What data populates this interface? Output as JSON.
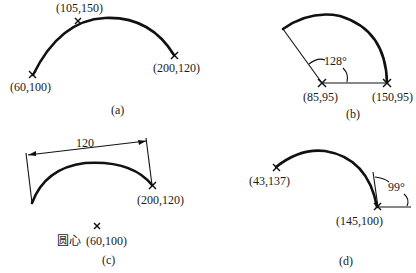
{
  "figures": {
    "a": {
      "caption": "(a)",
      "points": [
        "(105,150)",
        "(60,100)",
        "(200,120)"
      ],
      "description": "Three-point arc"
    },
    "b": {
      "caption": "(b)",
      "center_label": "(85,95)",
      "start_label": "(150,95)",
      "angle_label": "128°",
      "description": "Arc by center, start point and included angle"
    },
    "c": {
      "caption": "(c)",
      "chord_length": "120",
      "end_label": "(200,120)",
      "center_prefix": "圆心",
      "center_label": "(60,100)",
      "description": "Arc by center, end point and chord length"
    },
    "d": {
      "caption": "(d)",
      "start_label": "(43,137)",
      "end_label": "(145,100)",
      "angle_label": "99°",
      "description": "Arc by start, end and tangent direction"
    }
  }
}
